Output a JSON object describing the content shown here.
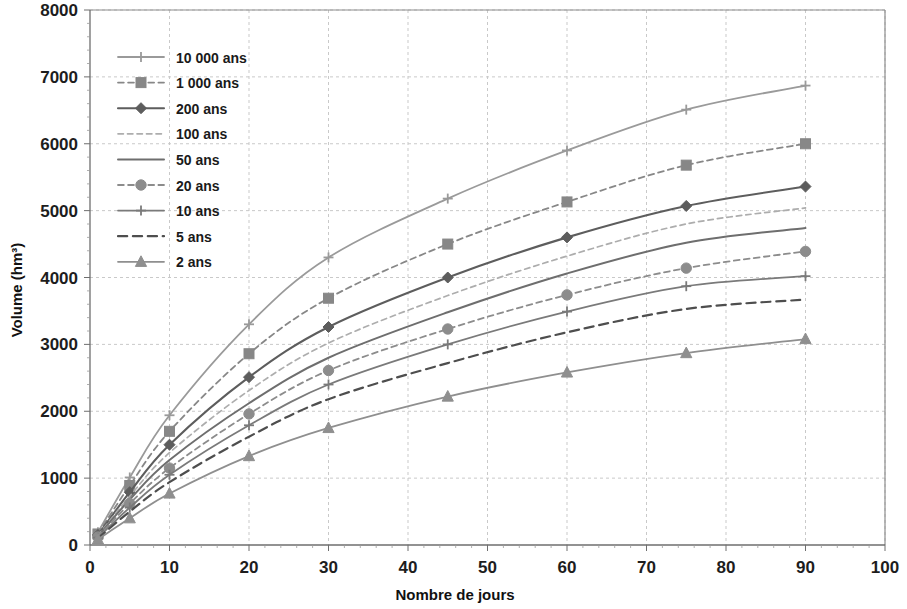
{
  "chart_data": {
    "type": "line",
    "title": "",
    "xlabel": "Nombre de jours",
    "ylabel": "Volume (hm³)",
    "xlim": [
      0,
      100
    ],
    "ylim": [
      0,
      8000
    ],
    "xticks": [
      0,
      10,
      20,
      30,
      40,
      50,
      60,
      70,
      80,
      90,
      100
    ],
    "xtick_labels": [
      "0",
      "10",
      "20",
      "30",
      "40",
      "50",
      "60",
      "70",
      "80",
      "90",
      "100"
    ],
    "yticks": [
      0,
      1000,
      2000,
      3000,
      4000,
      5000,
      6000,
      7000,
      8000
    ],
    "ytick_labels": [
      "0",
      "1000",
      "2000",
      "3000",
      "4000",
      "5000",
      "6000",
      "7000",
      "8000"
    ],
    "grid": true,
    "legend_position": "upper-left-inside",
    "x": [
      1,
      5,
      10,
      20,
      30,
      45,
      60,
      75,
      90
    ],
    "series": [
      {
        "name": "10 000 ans",
        "label": "10 000 ans",
        "values": [
          190,
          1010,
          1940,
          3300,
          4300,
          5180,
          5900,
          6510,
          6870
        ],
        "color": "#9a9a9a",
        "dash": "none",
        "marker": "plus",
        "width": 1.8
      },
      {
        "name": "1 000 ans",
        "label": "1 000 ans",
        "values": [
          165,
          890,
          1700,
          2860,
          3690,
          4500,
          5130,
          5680,
          6000
        ],
        "color": "#878787",
        "dash": "dashed",
        "marker": "square",
        "width": 1.8
      },
      {
        "name": "200 ans",
        "label": "200 ans",
        "values": [
          150,
          790,
          1500,
          2510,
          3260,
          4000,
          4600,
          5070,
          5360
        ],
        "color": "#5d5d5d",
        "dash": "none",
        "marker": "diamond",
        "width": 2.1
      },
      {
        "name": "100 ans",
        "label": "100 ans",
        "values": [
          140,
          730,
          1380,
          2310,
          3020,
          3730,
          4320,
          4800,
          5040
        ],
        "color": "#adadad",
        "dash": "dashed",
        "marker": "none",
        "width": 1.7
      },
      {
        "name": "50 ans",
        "label": "50 ans",
        "values": [
          130,
          680,
          1270,
          2120,
          2800,
          3480,
          4060,
          4520,
          4740
        ],
        "color": "#6e6e6e",
        "dash": "none",
        "marker": "none",
        "width": 2.0
      },
      {
        "name": "20 ans",
        "label": "20 ans",
        "values": [
          120,
          620,
          1150,
          1960,
          2610,
          3230,
          3740,
          4140,
          4390
        ],
        "color": "#8c8c8c",
        "dash": "dashed",
        "marker": "circle",
        "width": 1.8
      },
      {
        "name": "10 ans",
        "label": "10 ans",
        "values": [
          110,
          560,
          1050,
          1790,
          2400,
          3000,
          3490,
          3870,
          4020
        ],
        "color": "#7a7a7a",
        "dash": "none",
        "marker": "plus",
        "width": 1.8
      },
      {
        "name": "5 ans",
        "label": "5 ans",
        "values": [
          100,
          500,
          940,
          1620,
          2180,
          2720,
          3180,
          3530,
          3670
        ],
        "color": "#4e4e4e",
        "dash": "dashed-long",
        "marker": "none",
        "width": 2.2
      },
      {
        "name": "2 ans",
        "label": "2 ans",
        "values": [
          85,
          400,
          770,
          1330,
          1750,
          2220,
          2580,
          2870,
          3080
        ],
        "color": "#8f8f8f",
        "dash": "none",
        "marker": "triangle",
        "width": 1.8
      }
    ]
  },
  "legend": {
    "items": [
      {
        "label": "10 000 ans"
      },
      {
        "label": "1 000 ans"
      },
      {
        "label": "200 ans"
      },
      {
        "label": "100 ans"
      },
      {
        "label": "50 ans"
      },
      {
        "label": "20 ans"
      },
      {
        "label": "10 ans"
      },
      {
        "label": "5 ans"
      },
      {
        "label": "2 ans"
      }
    ]
  }
}
